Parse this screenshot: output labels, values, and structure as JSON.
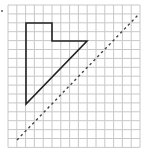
{
  "diagram": {
    "type": "grid-reflection",
    "grid": {
      "origin_x": 8,
      "origin_y": 5,
      "cols": 15,
      "rows": 16,
      "cell_w": 8.8,
      "cell_h": 8.9,
      "line_color": "#c8c8c8"
    },
    "shape": {
      "name": "L-triangle-polygon",
      "stroke": "#222222",
      "points": [
        [
          26,
          23
        ],
        [
          52,
          23
        ],
        [
          52,
          41
        ],
        [
          87,
          41
        ],
        [
          26,
          104
        ]
      ]
    },
    "mirror_line": {
      "style": "dashed",
      "stroke": "#444444",
      "x1": 17,
      "y1": 140,
      "x2": 139,
      "y2": 14
    }
  }
}
